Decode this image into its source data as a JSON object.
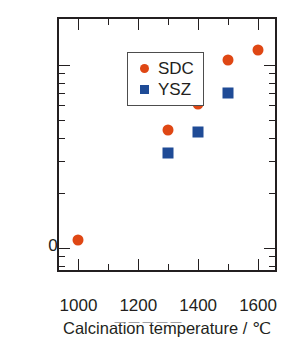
{
  "chart_data": {
    "type": "scatter",
    "title": "",
    "xlabel": "Calcination temperature / ℃",
    "ylabel": "Average particle size / μm",
    "xlim": [
      935,
      1670
    ],
    "ylim": [
      0.072,
      1.78
    ],
    "yscale": "log",
    "xscale": "linear",
    "grid": false,
    "legend_position": "upper-left-inside",
    "xticks": [
      1000,
      1200,
      1400,
      1600
    ],
    "xtick_labels": [
      "1000",
      "1200",
      "1400",
      "1600"
    ],
    "xminorticks": [
      1100,
      1300,
      1500
    ],
    "yticks": [
      0.1,
      1
    ],
    "ytick_labels": [
      "0.1",
      "1"
    ],
    "yminorticks": [
      0.08,
      0.09,
      0.2,
      0.3,
      0.4,
      0.5,
      0.6,
      0.7,
      0.8,
      0.9
    ],
    "series": [
      {
        "name": "SDC",
        "marker": "circle",
        "color": "#df4714",
        "x": [
          1000,
          1300,
          1400,
          1500,
          1600
        ],
        "values": [
          0.11,
          0.44,
          0.61,
          1.06,
          1.2
        ]
      },
      {
        "name": "YSZ",
        "marker": "square",
        "color": "#1f4b96",
        "x": [
          1300,
          1400,
          1500
        ],
        "values": [
          0.33,
          0.43,
          0.7
        ]
      }
    ],
    "legend_entries": [
      {
        "label": "SDC",
        "marker": "circle",
        "color": "#df4714"
      },
      {
        "label": "YSZ",
        "marker": "square",
        "color": "#1f4b96"
      }
    ]
  },
  "axis_titles": {
    "x": "Calcination temperature / ℃",
    "y": "Average particle size / μm"
  },
  "legend": {
    "sdc_label": "SDC",
    "ysz_label": "YSZ"
  },
  "colors": {
    "sdc": "#df4714",
    "ysz": "#1f4b96",
    "axis": "#231f20",
    "background": "#ffffff"
  },
  "caption": "— — — — —"
}
